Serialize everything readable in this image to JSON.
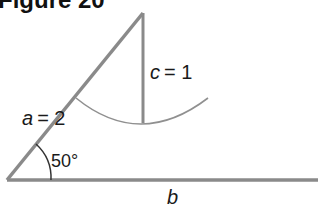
{
  "figure": {
    "title": "Figure 20"
  },
  "diagram": {
    "type": "triangle-construction (SSA ambiguous case)",
    "labels": {
      "side_a": "a = 2",
      "side_a_var": "a",
      "side_a_eq": "= 2",
      "side_c": "c = 1",
      "side_c_var": "c",
      "side_c_eq": "= 1",
      "side_b": "b",
      "angle": "50°"
    },
    "values": {
      "a": 2,
      "c": 1,
      "angle_deg": 50
    },
    "colors": {
      "line": "#8a8a8a",
      "arc": "#8f8f8f",
      "text": "#1a1a1a"
    }
  }
}
